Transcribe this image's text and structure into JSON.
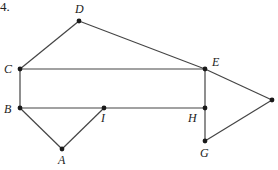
{
  "problem": {
    "number_label": "4."
  },
  "diagram": {
    "type": "geometry-figure",
    "stroke_color": "#444444",
    "point_color": "#1a1a1a",
    "points": [
      {
        "id": "D",
        "label": "D",
        "x": 79,
        "y": 21,
        "lx": 75,
        "ly": 13
      },
      {
        "id": "C",
        "label": "C",
        "x": 20,
        "y": 69,
        "lx": 4,
        "ly": 73
      },
      {
        "id": "E",
        "label": "E",
        "x": 205,
        "y": 69,
        "lx": 212,
        "ly": 66
      },
      {
        "id": "B",
        "label": "B",
        "x": 20,
        "y": 108,
        "lx": 4,
        "ly": 113
      },
      {
        "id": "I",
        "label": "I",
        "x": 104,
        "y": 108,
        "lx": 101,
        "ly": 122
      },
      {
        "id": "H",
        "label": "H",
        "x": 205,
        "y": 108,
        "lx": 188,
        "ly": 122
      },
      {
        "id": "A",
        "label": "A",
        "x": 62,
        "y": 149,
        "lx": 58,
        "ly": 164
      },
      {
        "id": "G",
        "label": "G",
        "x": 205,
        "y": 141,
        "lx": 200,
        "ly": 157
      },
      {
        "id": "F",
        "label": "",
        "x": 272,
        "y": 100,
        "lx": 276,
        "ly": 104
      }
    ],
    "segments": [
      [
        "C",
        "D"
      ],
      [
        "D",
        "E"
      ],
      [
        "C",
        "E"
      ],
      [
        "C",
        "B"
      ],
      [
        "B",
        "H"
      ],
      [
        "E",
        "H"
      ],
      [
        "B",
        "A"
      ],
      [
        "A",
        "I"
      ],
      [
        "E",
        "F"
      ],
      [
        "F",
        "G"
      ],
      [
        "G",
        "H"
      ]
    ]
  }
}
